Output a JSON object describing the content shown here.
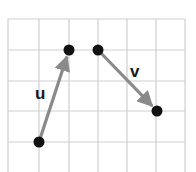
{
  "diagram": {
    "type": "vector-grid",
    "grid": {
      "x_lines": [
        8,
        39,
        69,
        98,
        127,
        156,
        185
      ],
      "y_lines": [
        19,
        50,
        81,
        111,
        142
      ],
      "color": "#cfcfcf"
    },
    "vectors": [
      {
        "label": "u",
        "from": [
          39,
          142
        ],
        "to": [
          69,
          50
        ],
        "label_pos": [
          35,
          99
        ]
      },
      {
        "label": "v",
        "from": [
          98,
          50
        ],
        "to": [
          157,
          111
        ],
        "label_pos": [
          130,
          77
        ]
      }
    ],
    "vector_color": "#8a8a8a",
    "point_color": "#111111"
  }
}
